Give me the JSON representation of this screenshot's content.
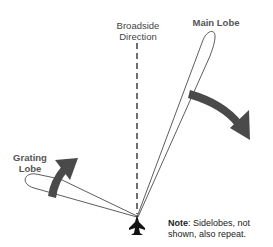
{
  "labels": {
    "broadside_line1": "Broadside",
    "broadside_line2": "Direction",
    "main_lobe": "Main Lobe",
    "grating_line1": "Grating",
    "grating_line2": "Lobe",
    "note_title": "Note",
    "note_text_line1": ":  Sidelobes, not",
    "note_text_line2": "shown, also repeat."
  },
  "icons": {
    "aircraft": "aircraft-icon",
    "main_arrow": "curved-arrow-right-down",
    "grating_arrow": "curved-arrow-up-right"
  },
  "colors": {
    "arrow": "#4a4a4a",
    "line": "#222222",
    "text": "#444444"
  }
}
